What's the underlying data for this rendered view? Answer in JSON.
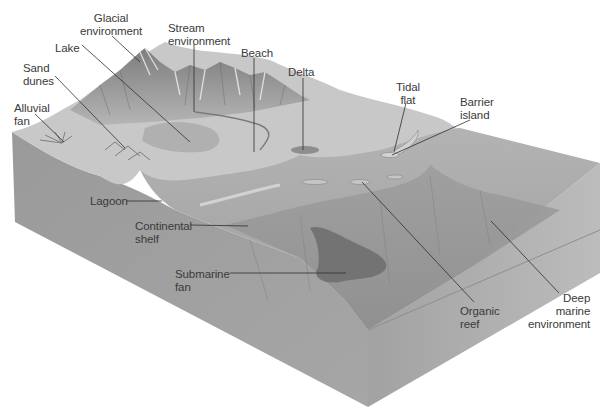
{
  "figure": {
    "colors": {
      "background": "#ffffff",
      "block_top_sea": "#a9a9a9",
      "block_front_face": "#9c9c9c",
      "block_right_face": "#b4b4b4",
      "land": "#c9c9c9",
      "mountains": "#8f8f8f",
      "submarine_fan": "#6e6e6e",
      "label_text": "#3a3a3a",
      "leader_line": "#2f2f2f"
    },
    "labels": [
      {
        "id": "glacial",
        "text": "Glacial\nenvironment"
      },
      {
        "id": "stream",
        "text": "Stream\nenvironment"
      },
      {
        "id": "lake",
        "text": "Lake"
      },
      {
        "id": "beach",
        "text": "Beach"
      },
      {
        "id": "delta",
        "text": "Delta"
      },
      {
        "id": "sand_dunes",
        "text": "Sand\ndunes"
      },
      {
        "id": "tidal_flat",
        "text": "Tidal\nflat"
      },
      {
        "id": "barrier_island",
        "text": "Barrier\nisland"
      },
      {
        "id": "alluvial_fan",
        "text": "Alluvial\nfan"
      },
      {
        "id": "lagoon",
        "text": "Lagoon"
      },
      {
        "id": "continental_shelf",
        "text": "Continental\nshelf"
      },
      {
        "id": "submarine_fan",
        "text": "Submarine\nfan"
      },
      {
        "id": "organic_reef",
        "text": "Organic\nreef"
      },
      {
        "id": "deep_marine",
        "text": "Deep\nmarine\nenvironment"
      }
    ]
  }
}
